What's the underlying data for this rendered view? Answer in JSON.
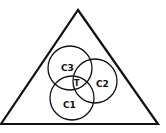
{
  "diagram": {
    "type": "venn-in-triangle",
    "colors": {
      "stroke": "#111111",
      "background": "#ffffff"
    },
    "circles": [
      {
        "id": "c3",
        "label": "C3"
      },
      {
        "id": "c2",
        "label": "C2"
      },
      {
        "id": "c1",
        "label": "C1"
      }
    ],
    "intersection_label": "T"
  }
}
